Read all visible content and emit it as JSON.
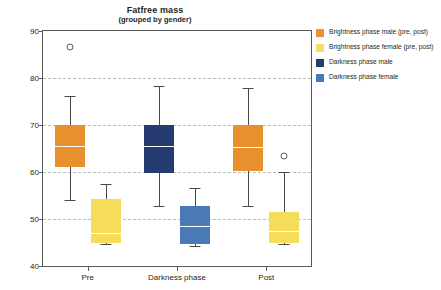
{
  "chart_data": {
    "type": "box",
    "title": "Fatfree mass",
    "subtitle": "(grouped by gender)",
    "xlabel": "",
    "ylabel": "Fatfree mass (kg)",
    "ylim": [
      40,
      90
    ],
    "yticks": [
      90,
      80,
      70,
      60,
      50,
      40
    ],
    "grid": "horizontal-dashed",
    "legend_position": "right",
    "categories": [
      "Pre",
      "Darkness phase",
      "Post"
    ],
    "series": [
      {
        "name": "Brightness phase male (pre, post)",
        "color": "#E8902E",
        "boxes": [
          {
            "category": "Pre",
            "whisker_low": 54.1,
            "q1": 61.0,
            "median": 65.5,
            "q3": 70.0,
            "whisker_high": 76.2,
            "outliers": [
              86.6
            ]
          },
          {
            "category": "Post",
            "whisker_low": 52.8,
            "q1": 60.2,
            "median": 65.3,
            "q3": 70.0,
            "whisker_high": 77.9,
            "outliers": []
          }
        ]
      },
      {
        "name": "Brightness phase female (pre, post)",
        "color": "#F5DC5A",
        "boxes": [
          {
            "category": "Pre",
            "whisker_low": 44.7,
            "q1": 44.9,
            "median": 47.0,
            "q3": 54.3,
            "whisker_high": 57.5,
            "outliers": []
          },
          {
            "category": "Post",
            "whisker_low": 44.7,
            "q1": 44.9,
            "median": 47.5,
            "q3": 51.5,
            "whisker_high": 59.9,
            "outliers": [
              63.4
            ]
          }
        ]
      },
      {
        "name": "Darkness phase male",
        "color": "#253B72",
        "boxes": [
          {
            "category": "Darkness phase",
            "whisker_low": 52.8,
            "q1": 59.8,
            "median": 65.5,
            "q3": 70.0,
            "whisker_high": 78.3,
            "outliers": []
          }
        ]
      },
      {
        "name": "Darkness phase female",
        "color": "#4A7AB5",
        "boxes": [
          {
            "category": "Darkness phase",
            "whisker_low": 44.3,
            "q1": 44.6,
            "median": 48.5,
            "q3": 52.8,
            "whisker_high": 56.5,
            "outliers": []
          }
        ]
      }
    ]
  },
  "legend": {
    "items": [
      {
        "label": "Brightness phase male (pre, post)",
        "color": "#E8902E"
      },
      {
        "label": "Brightness phase female (pre, post)",
        "color": "#F5DC5A"
      },
      {
        "label": "Darkness phase male",
        "color": "#253B72"
      },
      {
        "label": "Darkness phase female",
        "color": "#4A7AB5"
      }
    ]
  }
}
